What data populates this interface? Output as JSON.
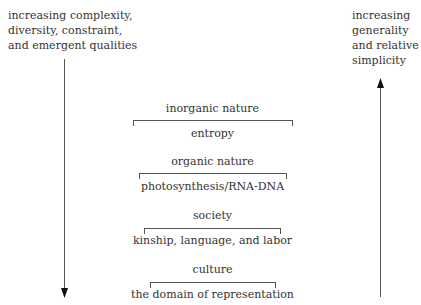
{
  "left_axis": {
    "lines": [
      "increasing complexity,",
      "diversity, constraint,",
      "and emergent qualities"
    ],
    "direction": "down"
  },
  "right_axis": {
    "lines": [
      "increasing",
      "generality",
      "and relative",
      "simplicity"
    ],
    "direction": "up"
  },
  "levels": [
    {
      "title": "inorganic nature",
      "sub": "entropy"
    },
    {
      "title": "organic nature",
      "sub": "photosynthesis/RNA-DNA"
    },
    {
      "title": "society",
      "sub": "kinship, language, and labor"
    },
    {
      "title": "culture",
      "sub": "the domain of representation"
    }
  ]
}
